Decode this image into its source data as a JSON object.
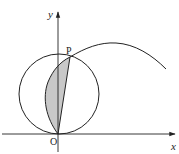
{
  "diagram": {
    "type": "geometry",
    "labels": {
      "y_axis": "y",
      "x_axis": "x",
      "origin": "O",
      "point_p": "P"
    },
    "colors": {
      "stroke": "#222222",
      "shade": "#c8c8c8",
      "background": "#ffffff"
    },
    "geometry_px": {
      "origin": [
        58,
        134
      ],
      "point_p": [
        70,
        57
      ],
      "circle_center": [
        59,
        94
      ],
      "circle_radius": 40,
      "curve_peak": [
        115,
        43
      ],
      "curve_end": [
        166,
        69
      ]
    }
  }
}
